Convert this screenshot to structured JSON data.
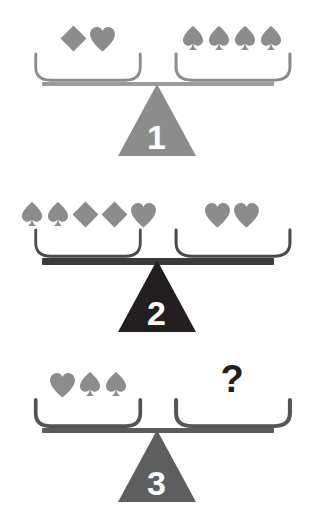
{
  "puzzle": {
    "title": "Balance scale symbol puzzle",
    "colors": {
      "symbol_gray": "#8c8c8c",
      "symbol_gray_light": "#9a9a9a",
      "beam_light": "#9b9b9b",
      "beam_dark": "#3a3a3c",
      "beam_mid": "#5b5b5b",
      "pan_light": "#8c8c8c",
      "pan_dark": "#4a4a4c",
      "pan_mid": "#555557",
      "fulcrum_1": "#8c8c8c",
      "fulcrum_2": "#231f20",
      "fulcrum_3": "#5e5e5e",
      "question_mark": "#231f20",
      "background": "#ffffff"
    },
    "scales": [
      {
        "number": "1",
        "fulcrum_color": "#8c8c8c",
        "beam_color": "#9b9b9b",
        "beam_thickness": 4,
        "pan_color": "#8c8c8c",
        "pan_thickness": 3,
        "left_items": [
          "diamond",
          "heart"
        ],
        "right_items": [
          "spade",
          "spade",
          "spade",
          "spade"
        ],
        "left_unknown": false,
        "right_unknown": false,
        "relation": "balanced"
      },
      {
        "number": "2",
        "fulcrum_color": "#231f20",
        "beam_color": "#3a3a3c",
        "beam_thickness": 7,
        "pan_color": "#4a4a4c",
        "pan_thickness": 3,
        "left_items": [
          "spade",
          "spade",
          "diamond",
          "diamond",
          "heart"
        ],
        "right_items": [
          "heart",
          "heart"
        ],
        "left_unknown": false,
        "right_unknown": false,
        "relation": "balanced"
      },
      {
        "number": "3",
        "fulcrum_color": "#5e5e5e",
        "beam_color": "#5b5b5b",
        "beam_thickness": 5,
        "pan_color": "#555557",
        "pan_thickness": 4,
        "left_items": [
          "heart",
          "spade",
          "spade"
        ],
        "right_items": [
          "question"
        ],
        "left_unknown": false,
        "right_unknown": true,
        "relation": "balanced"
      }
    ],
    "symbols": {
      "diamond": {
        "name": "diamond-symbol",
        "glyph": "♦"
      },
      "heart": {
        "name": "heart-symbol",
        "glyph": "♥"
      },
      "spade": {
        "name": "spade-symbol",
        "glyph": "♠"
      },
      "question": {
        "name": "question-mark",
        "glyph": "?"
      }
    }
  }
}
